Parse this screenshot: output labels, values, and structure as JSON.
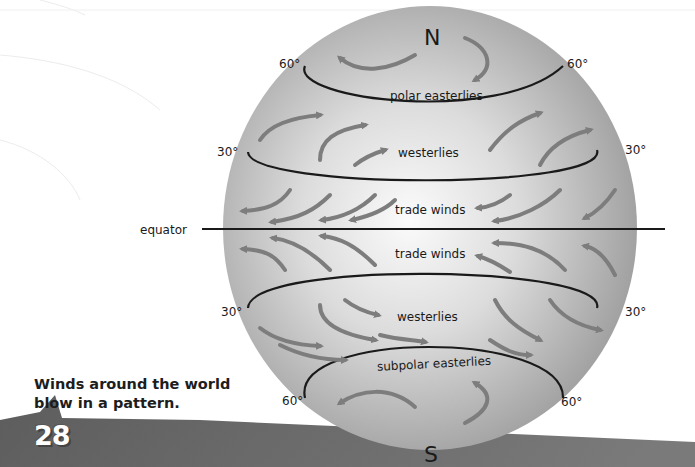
{
  "caption": {
    "line1": "Winds around the world",
    "line2": "blow in a pattern."
  },
  "page_number": "28",
  "poles": {
    "north": "N",
    "south": "S"
  },
  "latitude_labels": {
    "n60_left": "60°",
    "n60_right": "60°",
    "n30_left": "30°",
    "n30_right": "30°",
    "s30_left": "30°",
    "s30_right": "30°",
    "s60_left": "60°",
    "s60_right": "60°"
  },
  "equator_label": "equator",
  "wind_belts": {
    "polar_north": "polar easterlies",
    "westerlies_north": "westerlies",
    "trade_north": "trade winds",
    "trade_south": "trade winds",
    "westerlies_south": "westerlies",
    "polar_south": "subpolar easterlies"
  },
  "colors": {
    "globe_center": "#f7f7f7",
    "globe_edge": "#9a9a9a",
    "arrow": "#7d7d7d",
    "line": "#1a1a1a",
    "band": "#6e6e6e"
  }
}
